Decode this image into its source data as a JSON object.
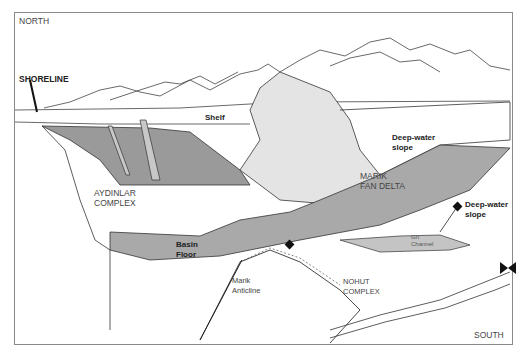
{
  "diagram": {
    "type": "geological block diagram",
    "orientation": {
      "top_left": "NORTH",
      "bottom_right": "SOUTH"
    },
    "labels": {
      "north": "NORTH",
      "south": "SOUTH",
      "shoreline": "SHORELINE",
      "shelf": "Shelf",
      "deep_water_slope_1": [
        "Deep-water",
        "slope"
      ],
      "deep_water_slope_2": [
        "Deep-water",
        "slope"
      ],
      "aydinlar": [
        "AYDINLAR",
        "COMPLEX"
      ],
      "marik_fan_delta": [
        "MARIK",
        "FAN DELTA"
      ],
      "basin_floor": [
        "Basin",
        "Floor"
      ],
      "marik_anticline": [
        "Marik",
        "Anticline"
      ],
      "nohut": [
        "NOHUT",
        "COMPLEX"
      ],
      "gn_channel": [
        "Gn",
        "Channel"
      ]
    },
    "colors": {
      "outline": "#333333",
      "basin_fill": "#a9a9a9",
      "aydinlar_fill": "#9a9a9a",
      "fan_fill": "#e4e4e4",
      "paper": "#ffffff",
      "frame": "#8a8a8a"
    }
  }
}
